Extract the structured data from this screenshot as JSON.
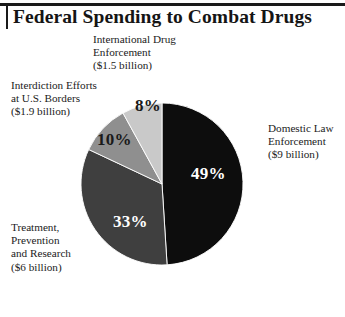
{
  "header": {
    "title": "Federal Spending to Combat Drugs"
  },
  "chart_data": {
    "type": "pie",
    "title": "Federal Spending to Combat Drugs",
    "start_angle_deg": 0,
    "direction": "clockwise",
    "units": "percent of total federal drug-control spending",
    "legend_position": "callout-labels",
    "grid": false,
    "categories": [
      "Domestic Law Enforcement",
      "Treatment, Prevention and Research",
      "Interdiction Efforts at U.S. Borders",
      "International Drug Enforcement"
    ],
    "values": [
      49,
      33,
      10,
      8
    ],
    "value_labels": [
      "49%",
      "33%",
      "10%",
      "8%"
    ],
    "amounts": [
      "$9 billion",
      "$6 billion",
      "$1.9 billion",
      "$1.5 billion"
    ],
    "colors": [
      "#0d0d0d",
      "#3f3f3f",
      "#8f8f8f",
      "#c9c9c9"
    ],
    "slices": [
      {
        "name": "domestic-law-enforcement",
        "label": "Domestic Law\nEnforcement\n($9 billion)",
        "value": 49,
        "value_label": "49%",
        "amount": "$9 billion",
        "color": "#0d0d0d",
        "label_color": "#ffffff"
      },
      {
        "name": "treatment-prevention-research",
        "label": "Treatment,\nPrevention\nand Research\n($6 billion)",
        "value": 33,
        "value_label": "33%",
        "amount": "$6 billion",
        "color": "#3f3f3f",
        "label_color": "#ffffff"
      },
      {
        "name": "interdiction-efforts",
        "label": "Interdiction Efforts\nat U.S. Borders\n($1.9 billion)",
        "value": 10,
        "value_label": "10%",
        "amount": "$1.9 billion",
        "color": "#8f8f8f",
        "label_color": "#1a1a1a"
      },
      {
        "name": "international-drug-enforcement",
        "label": "International Drug\nEnforcement\n($1.5 billion)",
        "value": 8,
        "value_label": "8%",
        "amount": "$1.5 billion",
        "color": "#c9c9c9",
        "label_color": "#1a1a1a"
      }
    ]
  }
}
